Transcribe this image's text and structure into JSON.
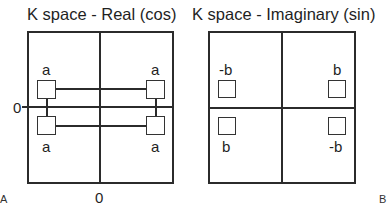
{
  "panels": [
    {
      "id": "A",
      "title": "K space - Real (cos)",
      "panel_label": "A",
      "axis_labels": {
        "x_zero": "0",
        "y_zero": "0"
      },
      "points": [
        {
          "quadrant": "upper-left",
          "label": "a"
        },
        {
          "quadrant": "upper-right",
          "label": "a"
        },
        {
          "quadrant": "lower-left",
          "label": "a"
        },
        {
          "quadrant": "lower-right",
          "label": "a"
        }
      ],
      "connected": true
    },
    {
      "id": "B",
      "title": "K space - Imaginary (sin)",
      "panel_label": "B",
      "points": [
        {
          "quadrant": "upper-left",
          "label": "-b"
        },
        {
          "quadrant": "upper-right",
          "label": "b"
        },
        {
          "quadrant": "lower-left",
          "label": "b"
        },
        {
          "quadrant": "lower-right",
          "label": "-b"
        }
      ],
      "connected": false
    }
  ]
}
